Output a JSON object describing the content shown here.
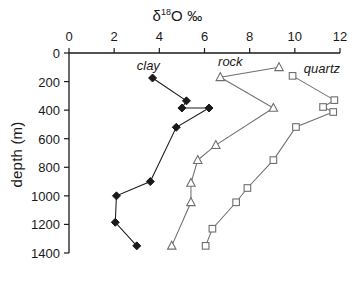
{
  "chart_data": {
    "type": "line",
    "title": "δ18O ‰",
    "title_parts": {
      "delta": "δ",
      "superscript": "18",
      "element": "O ‰"
    },
    "xlabel": "δ18O ‰",
    "ylabel": "depth (m)",
    "xlim": [
      0,
      12
    ],
    "ylim": [
      0,
      1400
    ],
    "y_inverted": true,
    "xticks": [
      0,
      2,
      4,
      6,
      8,
      10,
      12
    ],
    "xtick_labels": [
      "0",
      "2",
      "4",
      "6",
      "8",
      "10",
      "12"
    ],
    "yticks": [
      0,
      200,
      400,
      600,
      800,
      1000,
      1200,
      1400
    ],
    "ytick_labels": [
      "0",
      "200",
      "400",
      "600",
      "800",
      "1000",
      "1200",
      "1400"
    ],
    "grid": false,
    "legend_position": "inline-annotations",
    "series": [
      {
        "name": "clay",
        "marker": "filled-diamond",
        "color": "#1a1a1a",
        "fill": "#1a1a1a",
        "label_x": 3.0,
        "label_y": 90,
        "points": [
          {
            "x": 3.7,
            "y": 175
          },
          {
            "x": 5.2,
            "y": 335
          },
          {
            "x": 5.0,
            "y": 385
          },
          {
            "x": 6.2,
            "y": 385
          },
          {
            "x": 4.75,
            "y": 520
          },
          {
            "x": 3.6,
            "y": 900
          },
          {
            "x": 2.1,
            "y": 1000
          },
          {
            "x": 2.05,
            "y": 1185
          },
          {
            "x": 3.0,
            "y": 1350
          }
        ]
      },
      {
        "name": "rock",
        "marker": "open-triangle",
        "color": "#6e6e6e",
        "fill": "#ffffff",
        "label_x": 6.6,
        "label_y": 65,
        "points": [
          {
            "x": 9.3,
            "y": 100
          },
          {
            "x": 6.7,
            "y": 170
          },
          {
            "x": 9.05,
            "y": 385
          },
          {
            "x": 6.5,
            "y": 645
          },
          {
            "x": 5.7,
            "y": 750
          },
          {
            "x": 5.4,
            "y": 910
          },
          {
            "x": 5.4,
            "y": 1045
          },
          {
            "x": 4.55,
            "y": 1350
          }
        ]
      },
      {
        "name": "quartz",
        "marker": "open-square",
        "color": "#6e6e6e",
        "fill": "#ffffff",
        "label_x": 10.4,
        "label_y": 115,
        "points": [
          {
            "x": 9.9,
            "y": 160
          },
          {
            "x": 11.75,
            "y": 330
          },
          {
            "x": 11.25,
            "y": 378
          },
          {
            "x": 11.7,
            "y": 413
          },
          {
            "x": 10.05,
            "y": 518
          },
          {
            "x": 9.05,
            "y": 750
          },
          {
            "x": 7.9,
            "y": 945
          },
          {
            "x": 7.4,
            "y": 1045
          },
          {
            "x": 6.35,
            "y": 1230
          },
          {
            "x": 6.05,
            "y": 1350
          }
        ]
      }
    ]
  }
}
